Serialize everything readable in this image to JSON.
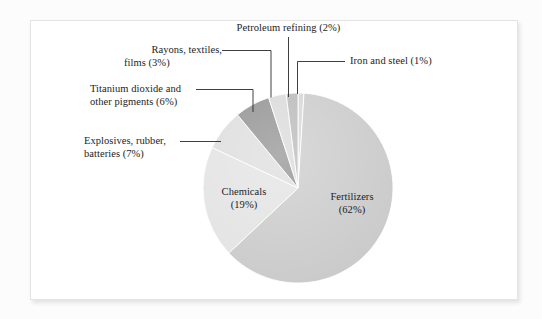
{
  "figure": {
    "background_color": "#ffffff",
    "page_color": "#fcfcfc",
    "border_color": "#e4e4e4"
  },
  "chart_data": {
    "type": "pie",
    "title": "",
    "subtitle": "",
    "xlabel": "",
    "ylabel": "",
    "grid": false,
    "legend_position": "none",
    "units": "percent",
    "start_angle_deg": 0,
    "direction": "clockwise",
    "categories": [
      "Iron and steel",
      "Fertilizers",
      "Chemicals",
      "Explosives, rubber, batteries",
      "Titanium dioxide and other pigments",
      "Rayons, textiles, films",
      "Petroleum refining"
    ],
    "values": [
      1,
      62,
      19,
      7,
      6,
      3,
      2
    ],
    "colors": [
      "#d4d4d4",
      "#c9c9c9",
      "#e2e2e2",
      "#dcdcdc",
      "#8d8d8d",
      "#d8d8d8",
      "#b6b6b6"
    ],
    "slices": [
      {
        "label": "Iron and steel",
        "value": 1,
        "percent_text": "(1%)",
        "color": "#d4d4d4",
        "label_placement": "callout-right"
      },
      {
        "label": "Fertilizers",
        "value": 62,
        "percent_text": "(62%)",
        "color": "#c9c9c9",
        "label_placement": "inside"
      },
      {
        "label": "Chemicals",
        "value": 19,
        "percent_text": "(19%)",
        "color": "#e2e2e2",
        "label_placement": "inside"
      },
      {
        "label": "Explosives, rubber,",
        "value": 7,
        "percent_text": "batteries (7%)",
        "color": "#dcdcdc",
        "label_placement": "callout-left"
      },
      {
        "label": "Titanium dioxide and",
        "value": 6,
        "percent_text": "other pigments (6%)",
        "color": "#8d8d8d",
        "label_placement": "callout-left"
      },
      {
        "label": "Rayons, textiles,",
        "value": 3,
        "percent_text": "films (3%)",
        "color": "#d8d8d8",
        "label_placement": "callout-left"
      },
      {
        "label": "Petroleum refining",
        "value": 2,
        "percent_text": "(2%)",
        "color": "#b6b6b6",
        "label_placement": "callout-top"
      }
    ]
  },
  "labels": {
    "petroleum_refining": "Petroleum refining (2%)",
    "rayons_line1": "Rayons, textiles,",
    "rayons_line2": "films (3%)",
    "iron_and_steel": "Iron and steel (1%)",
    "titanium_line1": "Titanium dioxide and",
    "titanium_line2": "other pigments (6%)",
    "explosives_line1": "Explosives, rubber,",
    "explosives_line2": "batteries (7%)",
    "chemicals_line1": "Chemicals",
    "chemicals_line2": "(19%)",
    "fertilizers_line1": "Fertilizers",
    "fertilizers_line2": "(62%)"
  }
}
